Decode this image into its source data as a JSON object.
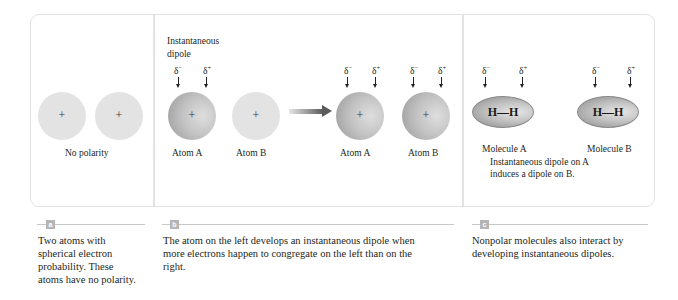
{
  "panels": {
    "a": {
      "atoms": [
        {
          "symbol": "+"
        },
        {
          "symbol": "+"
        }
      ],
      "label": "No polarity"
    },
    "b": {
      "heading_line1": "Instantaneous",
      "heading_line2": "dipole",
      "left_pair": {
        "delta_minus": "δ",
        "delta_plus": "δ",
        "minus_sign": "−",
        "plus_sign": "+",
        "atom_a_label": "Atom A",
        "atom_b_label": "Atom B",
        "atom_symbol": "+"
      },
      "right_pair": {
        "delta_minus": "δ",
        "delta_plus": "δ",
        "minus_sign": "−",
        "plus_sign": "+",
        "atom_a_label": "Atom A",
        "atom_b_label": "Atom B",
        "atom_symbol": "+"
      }
    },
    "c": {
      "molecule_a": {
        "formula_left": "H",
        "bond": "—",
        "formula_right": "H",
        "label": "Molecule A"
      },
      "molecule_b": {
        "formula_left": "H",
        "bond": "—",
        "formula_right": "H",
        "label": "Molecule B"
      },
      "delta_minus": "δ",
      "delta_plus": "δ",
      "minus_sign": "−",
      "plus_sign": "+",
      "note_line1": "Instantaneous dipole on A",
      "note_line2": "induces a dipole on B."
    }
  },
  "captions": [
    {
      "badge": "a",
      "text": "Two atoms with spherical electron probability. These atoms have no polarity."
    },
    {
      "badge": "b",
      "text": "The atom on the left develops an instantaneous dipole when more electrons happen to congregate on the left than on the right."
    },
    {
      "badge": "c",
      "text": "Nonpolar molecules also interact by developing instantaneous dipoles."
    }
  ],
  "colors": {
    "frame": "#e2e2e2",
    "neutral_atom": "#e3e3e3",
    "badge": "#b5b5b5",
    "arrow": "#5a5a5a"
  }
}
